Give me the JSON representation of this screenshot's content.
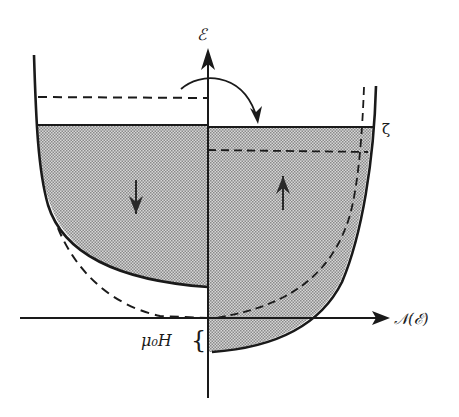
{
  "figure": {
    "type": "density-of-states diagram (Pauli paramagnetism)",
    "background_color": "#ffffff",
    "ink_color": "#1a1a1a",
    "fill_color": "#bdbdbd"
  },
  "axes": {
    "y_label": "ℰ",
    "x_label": "𝒩(ℰ)",
    "fermi_level_label": "ζ",
    "field_shift_label": "μ₀H",
    "field_shift_brace": "{"
  },
  "regions": [
    {
      "name": "spin-down band",
      "side": "left",
      "arrow": "down"
    },
    {
      "name": "spin-up band",
      "side": "right",
      "arrow": "up"
    }
  ],
  "annotations": {
    "transfer_arrow": "curved arrow from left band top to right band top",
    "dashed_lines": "initial (unequilibrated) occupancy levels"
  }
}
